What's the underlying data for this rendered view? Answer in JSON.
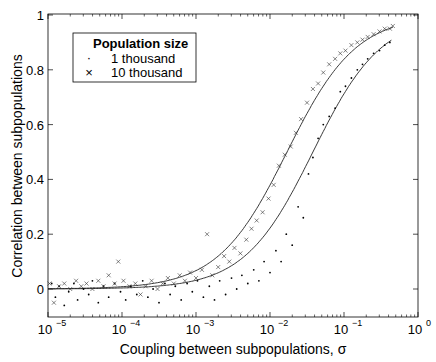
{
  "chart_data": {
    "type": "scatter",
    "title": "",
    "xlabel": "Coupling between subpopulations, σ",
    "ylabel": "Correlation between subpopulations",
    "xscale": "log",
    "xlim": [
      1e-05,
      1
    ],
    "ylim": [
      -0.1,
      1
    ],
    "x_ticks": [
      {
        "base": "10",
        "exp": "−5",
        "value": 1e-05
      },
      {
        "base": "10",
        "exp": "−4",
        "value": 0.0001
      },
      {
        "base": "10",
        "exp": "−3",
        "value": 0.001
      },
      {
        "base": "10",
        "exp": "−2",
        "value": 0.01
      },
      {
        "base": "10",
        "exp": "−1",
        "value": 0.1
      },
      {
        "base": "10",
        "exp": "0",
        "value": 1
      }
    ],
    "y_ticks": [
      "0",
      "0.2",
      "0.4",
      "0.6",
      "0.8",
      "1"
    ],
    "y_tick_values": [
      0,
      0.2,
      0.4,
      0.6,
      0.8,
      1
    ],
    "grid": false,
    "box": true,
    "legend": {
      "title": "Population size",
      "position": "upper left",
      "entries": [
        {
          "marker": "·",
          "label": "1 thousand"
        },
        {
          "marker": "×",
          "label": "10 thousand"
        }
      ]
    },
    "series": [
      {
        "name": "1 thousand",
        "marker": "dot",
        "fit_curve": {
          "type": "logistic_in_log10_sigma",
          "midpoint_log10": -1.42,
          "slope": 2.16,
          "x_range_log10": [
            -5,
            -0.35
          ]
        },
        "points_log10x_y": [
          [
            -4.95,
            0.02
          ],
          [
            -4.9,
            -0.03
          ],
          [
            -4.85,
            0.01
          ],
          [
            -4.78,
            -0.06
          ],
          [
            -4.72,
            -0.01
          ],
          [
            -4.65,
            0.02
          ],
          [
            -4.6,
            -0.04
          ],
          [
            -4.52,
            0.0
          ],
          [
            -4.45,
            -0.02
          ],
          [
            -4.4,
            0.03
          ],
          [
            -4.32,
            -0.05
          ],
          [
            -4.25,
            0.01
          ],
          [
            -4.18,
            -0.03
          ],
          [
            -4.1,
            0.02
          ],
          [
            -4.02,
            -0.01
          ],
          [
            -3.95,
            -0.04
          ],
          [
            -3.88,
            0.01
          ],
          [
            -3.8,
            -0.02
          ],
          [
            -3.72,
            0.03
          ],
          [
            -3.65,
            -0.03
          ],
          [
            -3.58,
            0.0
          ],
          [
            -3.5,
            -0.05
          ],
          [
            -3.42,
            0.02
          ],
          [
            -3.35,
            -0.02
          ],
          [
            -3.28,
            0.01
          ],
          [
            -3.2,
            -0.04
          ],
          [
            -3.12,
            0.02
          ],
          [
            -3.05,
            -0.01
          ],
          [
            -2.98,
            0.03
          ],
          [
            -2.9,
            -0.03
          ],
          [
            -2.82,
            0.01
          ],
          [
            -2.75,
            -0.04
          ],
          [
            -2.68,
            0.03
          ],
          [
            -2.6,
            -0.02
          ],
          [
            -2.52,
            0.04
          ],
          [
            -2.45,
            0.0
          ],
          [
            -2.38,
            0.05
          ],
          [
            -2.3,
            0.02
          ],
          [
            -2.22,
            0.07
          ],
          [
            -2.15,
            0.03
          ],
          [
            -2.08,
            0.1
          ],
          [
            -2.0,
            0.06
          ],
          [
            -1.92,
            0.14
          ],
          [
            -1.85,
            0.1
          ],
          [
            -1.78,
            0.2
          ],
          [
            -1.7,
            0.16
          ],
          [
            -1.62,
            0.3
          ],
          [
            -1.55,
            0.26
          ],
          [
            -1.48,
            0.42
          ],
          [
            -1.42,
            0.48
          ],
          [
            -1.35,
            0.55
          ],
          [
            -1.28,
            0.6
          ],
          [
            -1.2,
            0.63
          ],
          [
            -1.12,
            0.66
          ],
          [
            -1.05,
            0.72
          ],
          [
            -0.98,
            0.74
          ],
          [
            -0.9,
            0.77
          ],
          [
            -0.82,
            0.8
          ],
          [
            -0.75,
            0.82
          ],
          [
            -0.68,
            0.84
          ],
          [
            -0.6,
            0.86
          ],
          [
            -0.52,
            0.87
          ],
          [
            -0.45,
            0.89
          ],
          [
            -0.38,
            0.9
          ]
        ]
      },
      {
        "name": "10 thousand",
        "marker": "x",
        "fit_curve": {
          "type": "logistic_in_log10_sigma",
          "midpoint_log10": -1.77,
          "slope": 2.14,
          "x_range_log10": [
            -5,
            -0.34
          ]
        },
        "points_log10x_y": [
          [
            -4.98,
            0.02
          ],
          [
            -4.92,
            -0.05
          ],
          [
            -4.85,
            0.01
          ],
          [
            -4.78,
            0.02
          ],
          [
            -4.7,
            0.0
          ],
          [
            -4.62,
            0.03
          ],
          [
            -4.55,
            0.01
          ],
          [
            -4.48,
            0.02
          ],
          [
            -4.4,
            0.0
          ],
          [
            -4.32,
            0.03
          ],
          [
            -4.25,
            0.01
          ],
          [
            -4.18,
            0.05
          ],
          [
            -4.1,
            0.02
          ],
          [
            -4.05,
            0.1
          ],
          [
            -3.98,
            0.03
          ],
          [
            -3.9,
            0.01
          ],
          [
            -3.82,
            0.02
          ],
          [
            -3.75,
            -0.02
          ],
          [
            -3.68,
            0.01
          ],
          [
            -3.6,
            0.03
          ],
          [
            -3.52,
            0.0
          ],
          [
            -3.45,
            0.02
          ],
          [
            -3.38,
            0.04
          ],
          [
            -3.3,
            0.02
          ],
          [
            -3.22,
            0.05
          ],
          [
            -3.15,
            0.03
          ],
          [
            -3.08,
            0.06
          ],
          [
            -3.0,
            0.04
          ],
          [
            -2.92,
            0.07
          ],
          [
            -2.85,
            0.2
          ],
          [
            -2.78,
            0.05
          ],
          [
            -2.7,
            0.08
          ],
          [
            -2.62,
            0.12
          ],
          [
            -2.55,
            0.1
          ],
          [
            -2.48,
            0.15
          ],
          [
            -2.4,
            0.13
          ],
          [
            -2.32,
            0.18
          ],
          [
            -2.25,
            0.22
          ],
          [
            -2.18,
            0.25
          ],
          [
            -2.1,
            0.28
          ],
          [
            -2.02,
            0.33
          ],
          [
            -1.95,
            0.38
          ],
          [
            -1.88,
            0.45
          ],
          [
            -1.8,
            0.49
          ],
          [
            -1.72,
            0.52
          ],
          [
            -1.65,
            0.57
          ],
          [
            -1.58,
            0.62
          ],
          [
            -1.5,
            0.68
          ],
          [
            -1.42,
            0.73
          ],
          [
            -1.35,
            0.75
          ],
          [
            -1.28,
            0.79
          ],
          [
            -1.2,
            0.82
          ],
          [
            -1.12,
            0.84
          ],
          [
            -1.05,
            0.86
          ],
          [
            -0.98,
            0.87
          ],
          [
            -0.9,
            0.89
          ],
          [
            -0.82,
            0.9
          ],
          [
            -0.75,
            0.91
          ],
          [
            -0.68,
            0.92
          ],
          [
            -0.6,
            0.93
          ],
          [
            -0.52,
            0.94
          ],
          [
            -0.45,
            0.95
          ],
          [
            -0.38,
            0.95
          ],
          [
            -0.34,
            0.96
          ]
        ]
      }
    ]
  },
  "layout": {
    "plot_left": 48,
    "plot_right": 418,
    "plot_top": 14,
    "plot_bottom": 317,
    "y_zero_px": 289,
    "y_one_px": 15
  }
}
